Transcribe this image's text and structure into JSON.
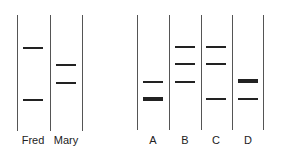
{
  "colors": {
    "lane_line": "#555555",
    "band": "#222222",
    "background": "#ffffff"
  },
  "gel_left": {
    "lane_lines_x": [
      17,
      50,
      82
    ],
    "top": 15,
    "bottom": 131,
    "lanes": [
      {
        "label": "Fred",
        "center_x": 33,
        "bands": [
          {
            "y": 48,
            "thick": false
          },
          {
            "y": 100,
            "thick": false
          }
        ]
      },
      {
        "label": "Mary",
        "center_x": 66,
        "bands": [
          {
            "y": 65,
            "thick": false
          },
          {
            "y": 83,
            "thick": false
          }
        ]
      }
    ]
  },
  "gel_right": {
    "lane_lines_x": [
      137,
      169,
      201,
      232,
      263
    ],
    "top": 15,
    "bottom": 130,
    "lanes": [
      {
        "label": "A",
        "center_x": 153,
        "bands": [
          {
            "y": 82,
            "thick": false
          },
          {
            "y": 99,
            "thick": true
          }
        ]
      },
      {
        "label": "B",
        "center_x": 185,
        "bands": [
          {
            "y": 47,
            "thick": false
          },
          {
            "y": 64,
            "thick": false
          },
          {
            "y": 82,
            "thick": false
          }
        ]
      },
      {
        "label": "C",
        "center_x": 216,
        "bands": [
          {
            "y": 47,
            "thick": false
          },
          {
            "y": 64,
            "thick": false
          },
          {
            "y": 99,
            "thick": false
          }
        ]
      },
      {
        "label": "D",
        "center_x": 248,
        "bands": [
          {
            "y": 81,
            "thick": true
          },
          {
            "y": 99,
            "thick": false
          }
        ]
      }
    ]
  },
  "label_y": 134
}
